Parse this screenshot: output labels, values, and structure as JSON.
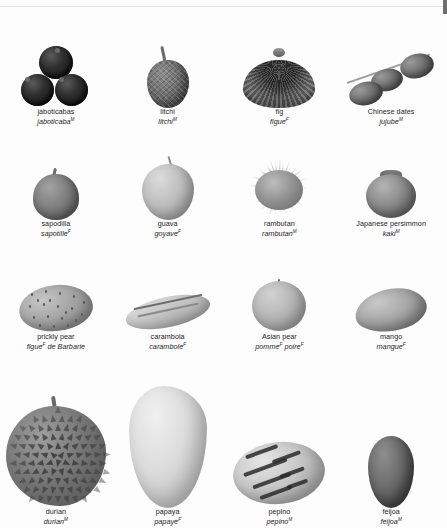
{
  "page": {
    "language_note": "English name with French equivalent in italics; superscript indicates grammatical gender (M = masculine, F = feminine)."
  },
  "rows": [
    {
      "index": 1,
      "items": [
        {
          "name": "jaboticabas",
          "fr": "jaboticaba",
          "fr_sup": "M",
          "icon": "jaboticaba-fruit-icon"
        },
        {
          "name": "litchi",
          "fr": "litchi",
          "fr_sup": "M",
          "icon": "litchi-fruit-icon"
        },
        {
          "name": "fig",
          "fr": "figue",
          "fr_sup": "F",
          "icon": "fig-fruit-icon"
        },
        {
          "name": "Chinese dates",
          "fr": "jujube",
          "fr_sup": "M",
          "icon": "jujube-fruit-icon"
        }
      ]
    },
    {
      "index": 2,
      "items": [
        {
          "name": "sapodilla",
          "fr": "sapotille",
          "fr_sup": "F",
          "icon": "sapodilla-fruit-icon"
        },
        {
          "name": "guava",
          "fr": "goyave",
          "fr_sup": "F",
          "icon": "guava-fruit-icon"
        },
        {
          "name": "rambutan",
          "fr": "rambutan",
          "fr_sup": "M",
          "icon": "rambutan-fruit-icon"
        },
        {
          "name": "Japanese persimmon",
          "fr": "kaki",
          "fr_sup": "M",
          "icon": "persimmon-fruit-icon"
        }
      ]
    },
    {
      "index": 3,
      "items": [
        {
          "name": "prickly pear",
          "fr": "figue",
          "fr_sup": "F",
          "fr_tail": " de Barbarie",
          "icon": "prickly-pear-fruit-icon"
        },
        {
          "name": "carambola",
          "fr": "carambole",
          "fr_sup": "F",
          "icon": "carambola-fruit-icon"
        },
        {
          "name": "Asian pear",
          "fr": "pomme",
          "fr_sup": "F",
          "fr_tail2": "poire",
          "fr_sup2": "F",
          "icon": "asian-pear-fruit-icon"
        },
        {
          "name": "mango",
          "fr": "mangue",
          "fr_sup": "F",
          "icon": "mango-fruit-icon"
        }
      ]
    },
    {
      "index": 4,
      "items": [
        {
          "name": "durian",
          "fr": "durian",
          "fr_sup": "M",
          "icon": "durian-fruit-icon"
        },
        {
          "name": "papaya",
          "fr": "papaye",
          "fr_sup": "F",
          "icon": "papaya-fruit-icon"
        },
        {
          "name": "pepino",
          "fr": "pepino",
          "fr_sup": "M",
          "icon": "pepino-fruit-icon"
        },
        {
          "name": "feijoa",
          "fr": "feijoa",
          "fr_sup": "M",
          "icon": "feijoa-fruit-icon"
        }
      ]
    }
  ],
  "colors": {
    "background": "#fdfdfd",
    "text": "#1c1c1c",
    "artwork_dark": "#2f2f2f",
    "artwork_light": "#dcdcdc"
  }
}
